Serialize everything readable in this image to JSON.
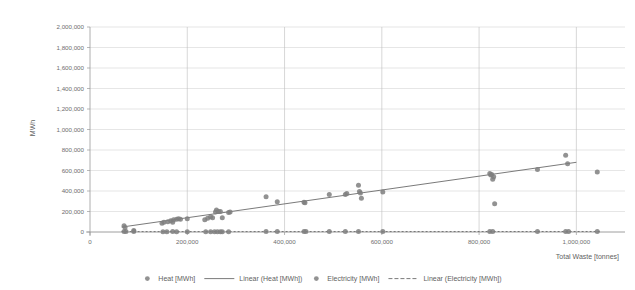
{
  "chart_data": {
    "type": "scatter",
    "title": "",
    "xlabel": "Total Waste [tonnes]",
    "ylabel": "MWh",
    "xlim": [
      0,
      1100000
    ],
    "ylim": [
      0,
      2000000
    ],
    "xticks": [
      0,
      200000,
      400000,
      600000,
      800000,
      1000000
    ],
    "xtick_labels": [
      "0",
      "200,000",
      "400,000",
      "600,000",
      "800,000",
      "1,000,000"
    ],
    "yticks": [
      0,
      200000,
      400000,
      600000,
      800000,
      1000000,
      1200000,
      1400000,
      1600000,
      1800000,
      2000000
    ],
    "ytick_labels": [
      "0",
      "200,000",
      "400,000",
      "600,000",
      "800,000",
      "1,000,000",
      "1,200,000",
      "1,400,000",
      "1,600,000",
      "1,800,000",
      "2,000,000"
    ],
    "grid": "both",
    "legend_position": "bottom",
    "marker_color": "#7f7f7f",
    "trendline_color": "#6b6b6b",
    "series": [
      {
        "name": "Heat [MWh]",
        "kind": "scatter",
        "color": "#7f7f7f",
        "points": [
          [
            70000,
            60000
          ],
          [
            72000,
            45000
          ],
          [
            90000,
            15000
          ],
          [
            148000,
            85000
          ],
          [
            152000,
            95000
          ],
          [
            160000,
            100000
          ],
          [
            166000,
            110000
          ],
          [
            170000,
            95000
          ],
          [
            172000,
            120000
          ],
          [
            178000,
            125000
          ],
          [
            182000,
            130000
          ],
          [
            186000,
            125000
          ],
          [
            200000,
            130000
          ],
          [
            236000,
            120000
          ],
          [
            242000,
            135000
          ],
          [
            248000,
            150000
          ],
          [
            252000,
            140000
          ],
          [
            258000,
            195000
          ],
          [
            260000,
            215000
          ],
          [
            264000,
            200000
          ],
          [
            268000,
            200000
          ],
          [
            272000,
            140000
          ],
          [
            285000,
            190000
          ],
          [
            288000,
            195000
          ],
          [
            362000,
            345000
          ],
          [
            385000,
            295000
          ],
          [
            440000,
            290000
          ],
          [
            442000,
            285000
          ],
          [
            492000,
            365000
          ],
          [
            525000,
            365000
          ],
          [
            528000,
            375000
          ],
          [
            552000,
            455000
          ],
          [
            554000,
            395000
          ],
          [
            556000,
            380000
          ],
          [
            558000,
            330000
          ],
          [
            602000,
            390000
          ],
          [
            822000,
            570000
          ],
          [
            824000,
            555000
          ],
          [
            826000,
            560000
          ],
          [
            828000,
            515000
          ],
          [
            830000,
            540000
          ],
          [
            832000,
            275000
          ],
          [
            920000,
            610000
          ],
          [
            978000,
            750000
          ],
          [
            982000,
            665000
          ],
          [
            1043000,
            585000
          ]
        ]
      },
      {
        "name": "Linear (Heat [MWh])",
        "kind": "trendline",
        "color": "#6b6b6b",
        "dash": "none",
        "x0": 65000,
        "y0": 48000,
        "x1": 1000000,
        "y1": 680000
      },
      {
        "name": "Electricity [MWh]",
        "kind": "scatter",
        "color": "#7f7f7f",
        "points": [
          [
            70000,
            5000
          ],
          [
            74000,
            4000
          ],
          [
            90000,
            4000
          ],
          [
            150000,
            3000
          ],
          [
            158000,
            3000
          ],
          [
            170000,
            4000
          ],
          [
            178000,
            3000
          ],
          [
            200000,
            3000
          ],
          [
            238000,
            3000
          ],
          [
            248000,
            3000
          ],
          [
            256000,
            3000
          ],
          [
            262000,
            3000
          ],
          [
            268000,
            3000
          ],
          [
            272000,
            3000
          ],
          [
            285000,
            3000
          ],
          [
            362000,
            4000
          ],
          [
            385000,
            4000
          ],
          [
            440000,
            4000
          ],
          [
            444000,
            4000
          ],
          [
            492000,
            4000
          ],
          [
            525000,
            4000
          ],
          [
            552000,
            4000
          ],
          [
            602000,
            4000
          ],
          [
            822000,
            4000
          ],
          [
            828000,
            4000
          ],
          [
            920000,
            4000
          ],
          [
            978000,
            4000
          ],
          [
            984000,
            4000
          ],
          [
            1043000,
            4000
          ]
        ]
      },
      {
        "name": "Linear (Electricity [MWh])",
        "kind": "trendline",
        "color": "#6b6b6b",
        "dash": "2,2",
        "x0": 65000,
        "y0": 4000,
        "x1": 1050000,
        "y1": 5000
      }
    ]
  },
  "axes": {
    "x_title": "Total Waste [tonnes]",
    "y_title": "MWh"
  },
  "legend": {
    "items": [
      {
        "label": "Heat [MWh]",
        "type": "marker"
      },
      {
        "label": "Linear (Heat [MWh])",
        "type": "line"
      },
      {
        "label": "Electricity [MWh]",
        "type": "marker"
      },
      {
        "label": "Linear (Electricity [MWh])",
        "type": "line-dashed"
      }
    ]
  }
}
